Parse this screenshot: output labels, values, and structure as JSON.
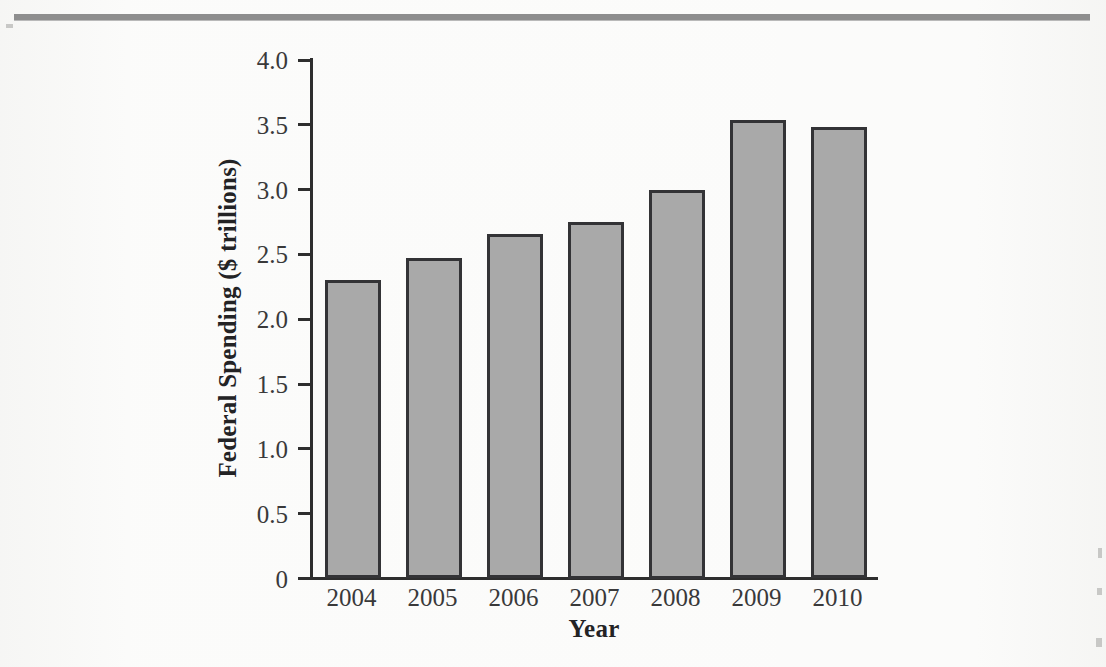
{
  "figure": {
    "background_color": "#fbfbfa",
    "rule_color": "#8e8e8e",
    "axis_color": "#2e2e2e",
    "bar_fill": "#a9a9a9",
    "bar_stroke": "#333336"
  },
  "chart_data": {
    "type": "bar",
    "title": "",
    "xlabel": "Year",
    "ylabel": "Federal Spending ($ trillions)",
    "categories": [
      "2004",
      "2005",
      "2006",
      "2007",
      "2008",
      "2009",
      "2010"
    ],
    "values": [
      2.3,
      2.47,
      2.66,
      2.75,
      3.0,
      3.54,
      3.48
    ],
    "ylim": [
      0,
      4.0
    ],
    "ytick_labels": [
      "4.0",
      "3.5",
      "3.0",
      "2.5",
      "2.0",
      "1.5",
      "1.0",
      "0.5",
      "0"
    ],
    "ytick_values": [
      4.0,
      3.5,
      3.0,
      2.5,
      2.0,
      1.5,
      1.0,
      0.5,
      0
    ],
    "grid": false,
    "legend": null,
    "legend_position": "none",
    "series": [
      {
        "name": "Federal Spending",
        "values": [
          2.3,
          2.47,
          2.66,
          2.75,
          3.0,
          3.54,
          3.48
        ]
      }
    ]
  }
}
